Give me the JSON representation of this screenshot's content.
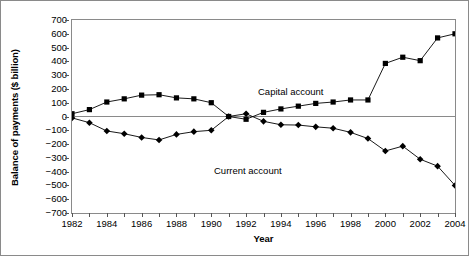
{
  "chart_data": {
    "type": "line",
    "title": "",
    "xlabel": "Year",
    "ylabel": "Balance of payments ($ billion)",
    "xlim": [
      1982,
      2004
    ],
    "ylim": [
      -700,
      700
    ],
    "ytick_values": [
      700,
      600,
      500,
      400,
      300,
      200,
      100,
      0,
      -100,
      -200,
      -300,
      -400,
      -500,
      -600,
      -700
    ],
    "ytick_labels": [
      "700",
      "600",
      "500",
      "400",
      "300",
      "200",
      "100",
      "0",
      "−100",
      "−200",
      "−300",
      "−400",
      "−500",
      "−600",
      "−700"
    ],
    "xtick_values": [
      1982,
      1984,
      1986,
      1988,
      1990,
      1992,
      1994,
      1996,
      1998,
      2000,
      2002,
      2004
    ],
    "xtick_labels": [
      "1982",
      "1984",
      "1986",
      "1988",
      "1990",
      "1992",
      "1994",
      "1996",
      "1998",
      "2000",
      "2002",
      "2004"
    ],
    "x": [
      1982,
      1983,
      1984,
      1985,
      1986,
      1987,
      1988,
      1989,
      1990,
      1991,
      1992,
      1993,
      1994,
      1995,
      1996,
      1997,
      1998,
      1999,
      2000,
      2001,
      2002,
      2003,
      2004
    ],
    "grid": false,
    "legend_position": "inline-annotation",
    "zero_line": true,
    "series": [
      {
        "name": "Capital account",
        "marker": "square",
        "color": "#000000",
        "values": [
          20,
          50,
          105,
          128,
          155,
          158,
          135,
          128,
          100,
          0,
          -20,
          30,
          55,
          75,
          95,
          105,
          120,
          120,
          385,
          430,
          405,
          570,
          600
        ]
      },
      {
        "name": "Current account",
        "marker": "diamond",
        "color": "#000000",
        "values": [
          -10,
          -45,
          -105,
          -125,
          -152,
          -170,
          -130,
          -110,
          -100,
          0,
          20,
          -35,
          -60,
          -62,
          -75,
          -85,
          -115,
          -160,
          -250,
          -215,
          -310,
          -360,
          -500
        ]
      }
    ],
    "annotations": [
      {
        "text": "Capital account",
        "x": 1990.2,
        "y": 290
      },
      {
        "text": "Current account",
        "x": 1987.6,
        "y": -200
      }
    ]
  }
}
